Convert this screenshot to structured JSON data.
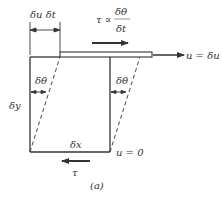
{
  "figure": {
    "caption": "(a)",
    "colors": {
      "stroke": "#333333",
      "background": "#ffffff"
    },
    "labels": {
      "displacement_rate": "δu δt",
      "shear_stress_relation_lhs": "τ ∝",
      "shear_stress_relation_num": "δθ",
      "shear_stress_relation_den": "δt",
      "top_velocity": "u = δu",
      "left_angle": "δθ",
      "right_angle": "δθ",
      "height": "δy",
      "width": "δx",
      "bottom_velocity": "u = 0",
      "bottom_stress": "τ"
    }
  }
}
